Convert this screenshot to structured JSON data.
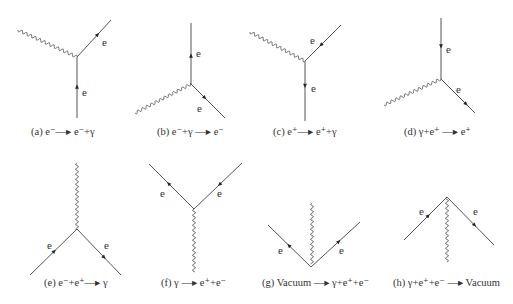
{
  "figure": {
    "label_letter": "e",
    "colors": {
      "line": "#555555",
      "photon": "#666666",
      "text": "#333333"
    },
    "panels": [
      {
        "id": "a",
        "caption": "(a) e⁻—▸ e⁻+γ",
        "caption_xy": [
          31,
          136
        ],
        "vertex": [
          77,
          57
        ],
        "photon": {
          "from": [
            18,
            30
          ],
          "to": [
            77,
            57
          ]
        },
        "fermions": [
          {
            "from": [
              77,
              118
            ],
            "to": [
              77,
              57
            ],
            "arrow_at": 0.55,
            "dir": "toward",
            "label_xy": [
              82,
              96
            ]
          },
          {
            "from": [
              77,
              57
            ],
            "to": [
              111,
              20
            ],
            "arrow_at": 0.65,
            "dir": "away",
            "label_xy": [
              102,
              46
            ]
          }
        ]
      },
      {
        "id": "b",
        "caption": "(b) e⁻+γ —▸ e⁻",
        "caption_xy": [
          157,
          136
        ],
        "vertex": [
          191,
          84
        ],
        "photon": {
          "from": [
            135,
            113
          ],
          "to": [
            191,
            84
          ]
        },
        "fermions": [
          {
            "from": [
              191,
              84
            ],
            "to": [
              191,
              23
            ],
            "arrow_at": 0.5,
            "dir": "away",
            "label_xy": [
              196,
              57
            ]
          },
          {
            "from": [
              191,
              84
            ],
            "to": [
              225,
              118
            ],
            "arrow_at": 0.45,
            "dir": "away",
            "label_xy": [
              197,
              112
            ]
          }
        ]
      },
      {
        "id": "c",
        "caption": "(c) e⁺—▸ e⁺+γ",
        "caption_xy": [
          273,
          136
        ],
        "vertex": [
          305,
          61
        ],
        "photon": {
          "from": [
            250,
            32
          ],
          "to": [
            305,
            61
          ]
        },
        "fermions": [
          {
            "from": [
              341,
              25
            ],
            "to": [
              305,
              61
            ],
            "arrow_at": 0.6,
            "dir": "toward",
            "label_xy": [
              310,
              44
            ]
          },
          {
            "from": [
              305,
              61
            ],
            "to": [
              305,
              121
            ],
            "arrow_at": 0.45,
            "dir": "away",
            "label_xy": [
              311,
              92
            ]
          }
        ]
      },
      {
        "id": "d",
        "caption": "(d) γ+e⁺ —▸ e⁺",
        "caption_xy": [
          404,
          136
        ],
        "vertex": [
          441,
          79
        ],
        "photon": {
          "from": [
            384,
            105
          ],
          "to": [
            441,
            79
          ]
        },
        "fermions": [
          {
            "from": [
              441,
              18
            ],
            "to": [
              441,
              79
            ],
            "arrow_at": 0.5,
            "dir": "toward",
            "label_xy": [
              446,
              53
            ]
          },
          {
            "from": [
              441,
              79
            ],
            "to": [
              475,
              113
            ],
            "arrow_at": 0.78,
            "dir": "away",
            "label_xy": [
              456,
              93
            ]
          }
        ]
      },
      {
        "id": "e",
        "caption": "(e) e⁻+e⁺—▸ γ",
        "caption_xy": [
          44,
          287
        ],
        "vertex": [
          77,
          229
        ],
        "photon": {
          "from": [
            77,
            163
          ],
          "to": [
            77,
            229
          ]
        },
        "fermions": [
          {
            "from": [
              30,
              275
            ],
            "to": [
              77,
              229
            ],
            "arrow_at": 0.55,
            "dir": "toward",
            "label_xy": [
              47,
              249
            ]
          },
          {
            "from": [
              77,
              229
            ],
            "to": [
              121,
              275
            ],
            "arrow_at": 0.65,
            "dir": "away",
            "label_xy": [
              104,
              249
            ]
          }
        ]
      },
      {
        "id": "f",
        "caption": "(f) γ —▸ e⁺+e⁻",
        "caption_xy": [
          161,
          287
        ],
        "vertex": [
          194,
          209
        ],
        "photon": {
          "from": [
            194,
            209
          ],
          "to": [
            194,
            272
          ]
        },
        "fermions": [
          {
            "from": [
              194,
              209
            ],
            "to": [
              149,
              164
            ],
            "arrow_at": 0.6,
            "dir": "away",
            "label_xy": [
              160,
              197
            ]
          },
          {
            "from": [
              242,
              163
            ],
            "to": [
              194,
              209
            ],
            "arrow_at": 0.5,
            "dir": "toward",
            "label_xy": [
              217,
              197
            ]
          }
        ]
      },
      {
        "id": "g",
        "caption": "(g) Vacuum —▸ γ+e⁺+e⁻",
        "caption_xy": [
          262,
          287
        ],
        "vertex": [
          311,
          267
        ],
        "photon": {
          "from": [
            312,
            203
          ],
          "to": [
            312,
            264
          ]
        },
        "fermions": [
          {
            "from": [
              311,
              267
            ],
            "to": [
              268,
              225
            ],
            "arrow_at": 0.55,
            "dir": "away",
            "label_xy": [
              278,
              254
            ]
          },
          {
            "from": [
              311,
              267
            ],
            "to": [
              360,
              222
            ],
            "arrow_at": 0.6,
            "dir": "away",
            "label_xy": [
              339,
              254
            ]
          }
        ]
      },
      {
        "id": "h",
        "caption": "(h) γ+e⁺+e⁻ —▸ Vacuum",
        "caption_xy": [
          393,
          287
        ],
        "vertex": [
          447,
          197
        ],
        "photon": {
          "from": [
            447,
            197
          ],
          "to": [
            447,
            262
          ]
        },
        "fermions": [
          {
            "from": [
              404,
              240
            ],
            "to": [
              447,
              197
            ],
            "arrow_at": 0.6,
            "dir": "toward",
            "label_xy": [
              419,
              215
            ]
          },
          {
            "from": [
              447,
              197
            ],
            "to": [
              494,
              245
            ],
            "arrow_at": 0.62,
            "dir": "away",
            "label_xy": [
              473,
              215
            ]
          }
        ]
      }
    ]
  }
}
